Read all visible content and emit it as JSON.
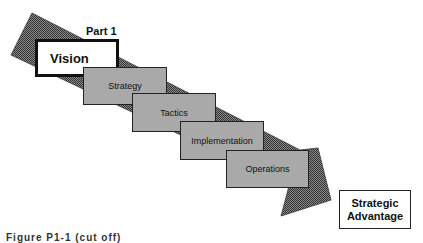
{
  "diagram": {
    "part_label": "Part 1",
    "arrow": {
      "fill": "#5a5a5a",
      "direction": "upper-left to lower-right"
    },
    "stages": [
      {
        "label": "Vision",
        "highlighted": true
      },
      {
        "label": "Strategy"
      },
      {
        "label": "Tactics"
      },
      {
        "label": "Implementation"
      },
      {
        "label": "Operations"
      }
    ],
    "outcome": {
      "line1": "Strategic",
      "line2": "Advantage"
    },
    "caption": "Figure P1-1 (cut off)"
  },
  "colors": {
    "stage_fill": "#a9a9a9",
    "arrow_fill": "#5a5a5a",
    "border": "#222222"
  }
}
